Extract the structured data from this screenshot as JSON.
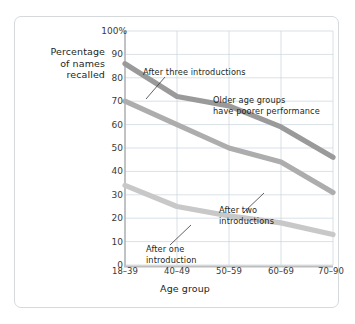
{
  "chart_data": {
    "type": "line",
    "title": "",
    "xlabel": "Age group",
    "ylabel": "Percentage\nof names\nrecalled",
    "ylabel_lines": [
      "Percentage",
      "of names",
      "recalled"
    ],
    "categories": [
      "18–39",
      "40–49",
      "50–59",
      "60–69",
      "70–90"
    ],
    "ylim": [
      0,
      100
    ],
    "yticks": [
      "0",
      "10",
      "20",
      "30",
      "40",
      "50",
      "60",
      "70",
      "80",
      "90",
      "100%"
    ],
    "ytick_values": [
      0,
      10,
      20,
      30,
      40,
      50,
      60,
      70,
      80,
      90,
      100
    ],
    "grid": true,
    "legend": "none",
    "series": [
      {
        "name": "After three introductions",
        "color": "#9a9a9a",
        "values": [
          86,
          72,
          68,
          59,
          46
        ]
      },
      {
        "name": "After two introductions",
        "color": "#adadad",
        "values": [
          70,
          60,
          50,
          44,
          31
        ]
      },
      {
        "name": "After one introduction",
        "color": "#c8c8c8",
        "values": [
          34,
          25,
          21,
          18,
          13
        ]
      }
    ],
    "annotations": [
      {
        "name": "after-three-introductions",
        "text": "After three introductions",
        "lines": [
          "After three introductions"
        ]
      },
      {
        "name": "older-age-groups",
        "text": "Older age groups\nhave poorer performance",
        "lines": [
          "Older age groups",
          "have poorer performance"
        ]
      },
      {
        "name": "after-two-introductions",
        "text": "After two\nintroductions",
        "lines": [
          "After two",
          "introductions"
        ]
      },
      {
        "name": "after-one-introduction",
        "text": "After one\nintroduction",
        "lines": [
          "After one",
          "introduction"
        ]
      }
    ],
    "colors": {
      "grid": "#c9d4de",
      "axis": "#b8b8b8",
      "card_border": "#d6d9dc",
      "background": "#ffffff",
      "text": "#231f20"
    }
  }
}
